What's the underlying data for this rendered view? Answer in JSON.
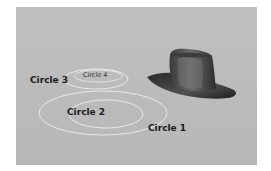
{
  "scene": {
    "background_color": "#bdbdbd",
    "ring_color": "#eeeeee",
    "object": "cowboy-hat"
  },
  "labels": {
    "circle1": "Circle 1",
    "circle2": "Circle 2",
    "circle3": "Circle 3",
    "circle4": "Circle 4"
  }
}
